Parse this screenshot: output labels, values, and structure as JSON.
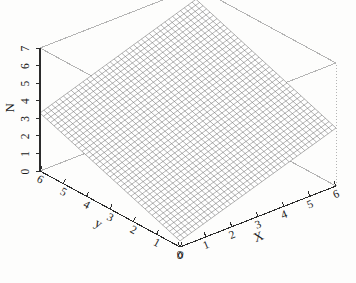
{
  "chart_data": {
    "type": "surface",
    "title": "",
    "projection": "3d-mesh-wireframe",
    "xlabel": "X",
    "ylabel": "y",
    "zlabel": "N",
    "xlim": [
      0,
      6
    ],
    "ylim": [
      0,
      6
    ],
    "zlim": [
      0,
      7
    ],
    "x_ticks": [
      0,
      1,
      2,
      3,
      4,
      5,
      6
    ],
    "y_ticks": [
      0,
      1,
      2,
      3,
      4,
      5,
      6
    ],
    "z_ticks": [
      0,
      1,
      2,
      3,
      4,
      5,
      6,
      7
    ],
    "x_tick_labels": [
      "0",
      "1",
      "2",
      "3",
      "4",
      "5",
      "6"
    ],
    "y_tick_labels": [
      "0",
      "1",
      "2",
      "3",
      "4",
      "5",
      "6"
    ],
    "z_tick_labels": [
      "0",
      "1",
      "2",
      "3",
      "4",
      "5",
      "6",
      "7"
    ],
    "grid": false,
    "legend": "none",
    "mesh_divisions": 40,
    "surface_description": "planar tilted mesh surface N increasing with x and y",
    "corner_values": {
      "x0_y0": 0.35,
      "x6_y0": 3.3,
      "x0_y6": 3.3,
      "x6_y6": 6.3
    },
    "series": [
      {
        "name": "N(x,y)",
        "formula_readout": "approximately linear plane rising from front corner to back corner",
        "z_at_corners": [
          0.35,
          3.3,
          3.3,
          6.3
        ]
      }
    ],
    "view": {
      "azimuth_deg": 45,
      "elevation_deg": 22
    },
    "colors": {
      "mesh_line": "#4a4a4a",
      "box_line": "#b4b4b4",
      "axis_line": "#2b2b2b",
      "text": "#1a1a1a",
      "background": "#fdfdfc"
    }
  },
  "axes": {
    "x": {
      "label": "X",
      "ticks": [
        "0",
        "1",
        "2",
        "3",
        "4",
        "5",
        "6"
      ]
    },
    "y": {
      "label": "y",
      "ticks": [
        "0",
        "1",
        "2",
        "3",
        "4",
        "5",
        "6"
      ]
    },
    "z": {
      "label": "N",
      "ticks": [
        "0",
        "1",
        "2",
        "3",
        "4",
        "5",
        "6",
        "7"
      ]
    }
  }
}
